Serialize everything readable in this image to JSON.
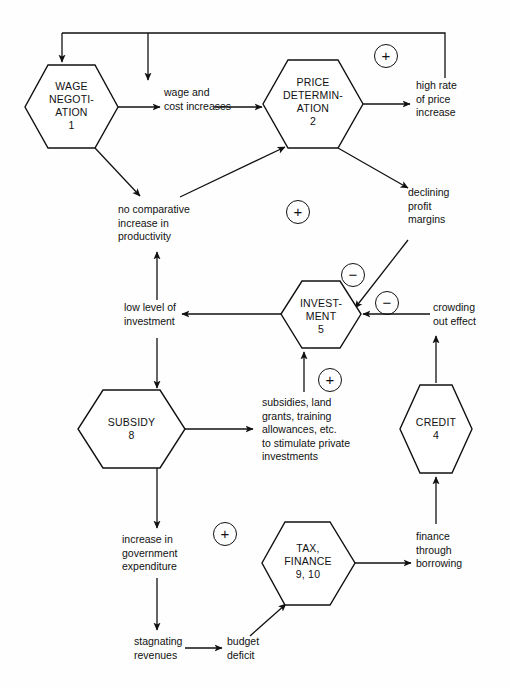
{
  "diagram": {
    "background_color": "#fefefe",
    "line_color": "#111111",
    "nodes": [
      {
        "id": "wage",
        "label_lines": "WAGE\nNEGOTI-\nATION\n1",
        "line1": "WAGE",
        "line2": "NEGOTI-",
        "line3": "ATION",
        "line4": "1"
      },
      {
        "id": "price",
        "label_lines": "PRICE\nDETERMIN-\nATION\n2",
        "line1": "PRICE",
        "line2": "DETERMIN-",
        "line3": "ATION",
        "line4": "2"
      },
      {
        "id": "investment",
        "label_lines": "INVEST-\nMENT\n5",
        "line1": "INVEST-",
        "line2": "MENT",
        "line3": "5",
        "line4": ""
      },
      {
        "id": "subsidy",
        "label_lines": "SUBSIDY\n8",
        "line1": "SUBSIDY",
        "line2": "8",
        "line3": "",
        "line4": ""
      },
      {
        "id": "credit",
        "label_lines": "CREDIT\n4",
        "line1": "CREDIT",
        "line2": "4",
        "line3": "",
        "line4": ""
      },
      {
        "id": "tax",
        "label_lines": "TAX,\nFINANCE\n9, 10",
        "line1": "TAX,",
        "line2": "FINANCE",
        "line3": "9, 10",
        "line4": ""
      }
    ],
    "annotations": [
      {
        "id": "wage-cost-increases",
        "text": "wage and\ncost increases"
      },
      {
        "id": "high-rate-price",
        "text": "high rate\nof price\nincrease"
      },
      {
        "id": "declining-profit",
        "text": "declining\nprofit\nmargins"
      },
      {
        "id": "no-comparative",
        "text": "no comparative\nincrease in\nproductivity"
      },
      {
        "id": "low-level-investment",
        "text": "low level of\ninvestment"
      },
      {
        "id": "crowding-out",
        "text": "crowding\nout effect"
      },
      {
        "id": "subsidies-list",
        "text": "subsidies, land\ngrants, training\nallowances, etc.\nto stimulate private\ninvestments"
      },
      {
        "id": "increase-gov-exp",
        "text": "increase in\ngovernment\nexpenditure"
      },
      {
        "id": "finance-borrowing",
        "text": "finance\nthrough\nborrowing"
      },
      {
        "id": "stagnating-revenues",
        "text": "stagnating\nrevenues"
      },
      {
        "id": "budget-deficit",
        "text": "budget\ndeficit"
      }
    ],
    "polarities": [
      {
        "id": "plus-top",
        "symbol": "+"
      },
      {
        "id": "plus-middle",
        "symbol": "+"
      },
      {
        "id": "minus-profit",
        "symbol": "−"
      },
      {
        "id": "minus-crowding",
        "symbol": "−"
      },
      {
        "id": "plus-subsidies",
        "symbol": "+"
      },
      {
        "id": "plus-bottom",
        "symbol": "+"
      }
    ]
  }
}
